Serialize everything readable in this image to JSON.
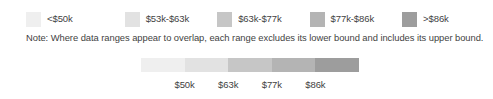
{
  "legend": {
    "items": [
      {
        "label": "<$50k",
        "color": "#efefef"
      },
      {
        "label": "$53k-$63k",
        "color": "#e2e2e2"
      },
      {
        "label": "$63k-$77k",
        "color": "#c6c6c6"
      },
      {
        "label": "$77k-$86k",
        "color": "#b4b4b4"
      },
      {
        "label": ">$86k",
        "color": "#9d9d9d"
      }
    ]
  },
  "note": {
    "text": "Note: Where data ranges appear to overlap, each range excludes its lower bound and includes its upper bound."
  },
  "scale": {
    "segments": [
      {
        "color": "#efefef"
      },
      {
        "color": "#e2e2e2"
      },
      {
        "color": "#c6c6c6"
      },
      {
        "color": "#b4b4b4"
      },
      {
        "color": "#9d9d9d"
      }
    ],
    "ticks": [
      {
        "label": "$50k",
        "position_pct": 20
      },
      {
        "label": "$63k",
        "position_pct": 40
      },
      {
        "label": "$77k",
        "position_pct": 60
      },
      {
        "label": "$86k",
        "position_pct": 80
      }
    ]
  },
  "chart_data": {
    "type": "bar",
    "title": "",
    "subtitle": "",
    "xlabel": "",
    "ylabel": "",
    "legend_position": "top",
    "grid": false,
    "categories": [
      "<$50k",
      "$53k-$63k",
      "$63k-$77k",
      "$77k-$86k",
      ">$86k"
    ],
    "values": [
      1,
      1,
      1,
      1,
      1
    ],
    "colors": [
      "#efefef",
      "#e2e2e2",
      "#c6c6c6",
      "#b4b4b4",
      "#9d9d9d"
    ],
    "tick_labels": [
      "$50k",
      "$63k",
      "$77k",
      "$86k"
    ],
    "annotations": [
      "Note: Where data ranges appear to overlap, each range excludes its lower bound and includes its upper bound."
    ]
  }
}
